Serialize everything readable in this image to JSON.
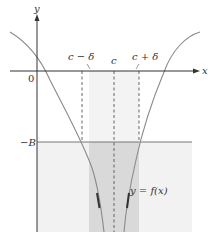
{
  "diagram": {
    "labels": {
      "y_axis": "y",
      "x_axis": "x",
      "origin": "0",
      "c_minus_delta": "c − δ",
      "c": "c",
      "c_plus_delta": "c + δ",
      "neg_B": "−B",
      "curve": "y = f(x)"
    },
    "colors": {
      "axis": "#333333",
      "curve": "#8a8a8a",
      "curve_arrow": "#444444",
      "light_region": "#f2f2f2",
      "delta_band_upper": "#ececec",
      "delta_band_lower": "#d6d6d6",
      "B_line": "#777777",
      "dashed": "#555555"
    }
  }
}
